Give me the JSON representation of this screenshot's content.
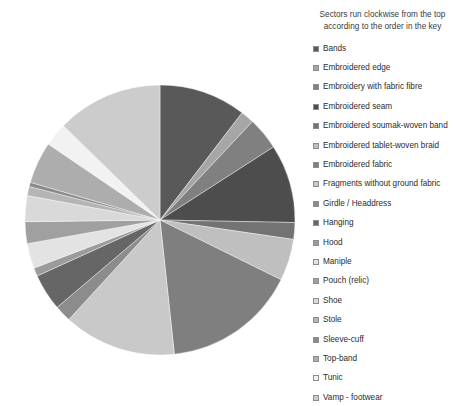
{
  "legend": {
    "note_line1": "Sectors run clockwise from the top",
    "note_line2": "according to the order in the key"
  },
  "chart_data": {
    "type": "pie",
    "title": "",
    "subtitle": "Sectors run clockwise from the top according to the order in the key",
    "start_angle_deg": 0,
    "direction": "clockwise",
    "legend_position": "right",
    "grid": false,
    "labels": [
      "Bands",
      "Embroidered edge",
      "Embroidery with fabric fibre",
      "Embroidered seam",
      "Embroidered soumak-woven band",
      "Embroidered tablet-woven braid",
      "Embroidered fabric",
      "Fragments without ground fabric",
      "Girdle / Headdress",
      "Hanging",
      "Hood",
      "Maniple",
      "Pouch (relic)",
      "Shoe",
      "Stole",
      "Sleeve-cuff",
      "Top-band",
      "Tunic",
      "Vamp - footwear"
    ],
    "values": [
      10.4,
      1.6,
      3.9,
      9.4,
      2.0,
      5.0,
      16.0,
      13.5,
      2.0,
      4.4,
      1.0,
      3.0,
      2.6,
      3.1,
      1.1,
      0.5,
      5.0,
      2.8,
      12.7
    ],
    "colors": [
      "#595959",
      "#a6a6a6",
      "#808080",
      "#4d4d4d",
      "#737373",
      "#bfbfbf",
      "#7f7f7f",
      "#c9c9c9",
      "#8c8c8c",
      "#666666",
      "#9b9b9b",
      "#e3e3e3",
      "#a0a0a0",
      "#d9d9d9",
      "#b5b5b5",
      "#8a8a8a",
      "#adadad",
      "#f2f2f2",
      "#cccccc"
    ]
  }
}
